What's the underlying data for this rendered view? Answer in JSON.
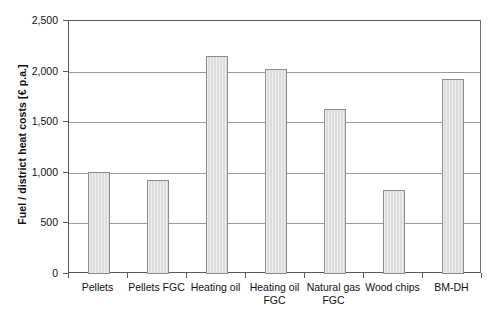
{
  "chart_data": {
    "type": "bar",
    "title": "",
    "subtitle": "",
    "xlabel": "",
    "ylabel": "Fuel / district heat costs [€ p.a.]",
    "categories": [
      "Pellets",
      "Pellets FGC",
      "Heating oil",
      "Heating oil\nFGC",
      "Natural gas\nFGC",
      "Wood chips",
      "BM-DH"
    ],
    "values": [
      1010,
      925,
      2150,
      2030,
      1635,
      830,
      1930
    ],
    "ylim": [
      0,
      2500
    ],
    "ytick_values": [
      0,
      500,
      1000,
      1500,
      2000,
      2500
    ],
    "ytick_labels": [
      "0",
      "500",
      "1,000",
      "1,500",
      "2,000",
      "2,500"
    ],
    "grid": true,
    "grid_axis": "y",
    "legend": false,
    "legend_position": "none",
    "bar_fill_color": "#dcdcdc",
    "bar_border_color": "#8c8c8c",
    "axis_color": "#5a5a5a",
    "gridline_color": "#9a9a9a",
    "annotations": []
  }
}
